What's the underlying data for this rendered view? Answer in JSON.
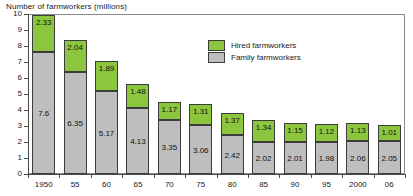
{
  "chart_data": {
    "type": "bar",
    "subtype": "stacked-bar",
    "title": "Number of farmworkers (millions)",
    "xlabel": "",
    "ylabel": "",
    "ylim": [
      0,
      10
    ],
    "ytick_labels": [
      "0",
      "1",
      "2",
      "3",
      "4",
      "5",
      "6",
      "7",
      "8",
      "9",
      "10"
    ],
    "ytick_values": [
      0,
      1,
      2,
      3,
      4,
      5,
      6,
      7,
      8,
      9,
      10
    ],
    "grid": false,
    "legend_position": "upper-center-right",
    "categories": [
      "1950",
      "55",
      "60",
      "65",
      "70",
      "75",
      "80",
      "85",
      "90",
      "95",
      "2000",
      "06"
    ],
    "series": [
      {
        "name": "Family farmworkers",
        "color": "#BEBEBE",
        "values": [
          7.6,
          6.35,
          5.17,
          4.13,
          3.35,
          3.06,
          2.42,
          2.02,
          2.01,
          1.98,
          2.06,
          2.05
        ],
        "labels": [
          "7.6",
          "6.35",
          "5.17",
          "4.13",
          "3.35",
          "3.06",
          "2.42",
          "2.02",
          "2.01",
          "1.98",
          "2.06",
          "2.05"
        ]
      },
      {
        "name": "Hired farmworkers",
        "color": "#8CC63F",
        "values": [
          2.33,
          2.04,
          1.89,
          1.48,
          1.17,
          1.31,
          1.37,
          1.34,
          1.15,
          1.12,
          1.13,
          1.01
        ],
        "labels": [
          "2.33",
          "2.04",
          "1.89",
          "1.48",
          "1.17",
          "1.31",
          "1.37",
          "1.34",
          "1.15",
          "1.12",
          "1.13",
          "1.01"
        ]
      }
    ],
    "totals": [
      9.93,
      8.39,
      7.06,
      5.61,
      4.52,
      4.37,
      3.79,
      3.36,
      3.16,
      3.1,
      3.19,
      3.06
    ]
  },
  "legend": {
    "items": [
      {
        "label": "Hired farmworkers",
        "swatch": "hired"
      },
      {
        "label": "Family farmworkers",
        "swatch": "family"
      }
    ]
  }
}
